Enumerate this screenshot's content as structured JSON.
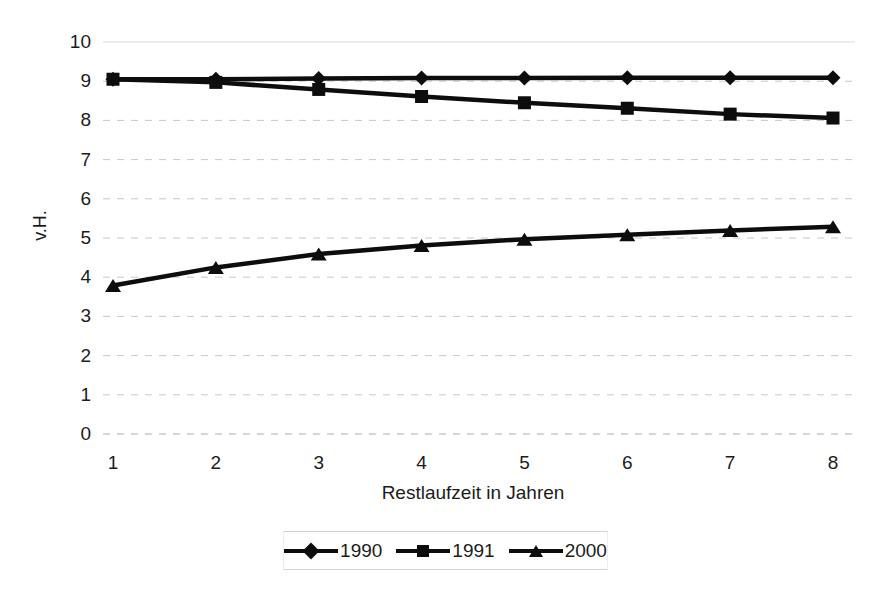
{
  "chart_data": {
    "type": "line",
    "title": "",
    "subtitle": "",
    "xlabel": "Restlaufzeit in Jahren",
    "ylabel": "v.H.",
    "x": [
      1,
      2,
      3,
      4,
      5,
      6,
      7,
      8
    ],
    "categories": [
      "1",
      "2",
      "3",
      "4",
      "5",
      "6",
      "7",
      "8"
    ],
    "xlim": [
      1,
      8
    ],
    "ylim": [
      0,
      10
    ],
    "ytick_labels": [
      "10",
      "9",
      "8",
      "7",
      "6",
      "5",
      "4",
      "3",
      "2",
      "1",
      "0"
    ],
    "ytick_values": [
      10,
      9,
      8,
      7,
      6,
      5,
      4,
      3,
      2,
      1,
      0
    ],
    "grid": "horizontal-dashed",
    "legend_position": "bottom",
    "series": [
      {
        "name": "1990",
        "marker": "diamond",
        "color": "#0d0d0d",
        "values": [
          9.05,
          9.05,
          9.07,
          9.08,
          9.08,
          9.09,
          9.09,
          9.09
        ]
      },
      {
        "name": "1991",
        "marker": "square",
        "color": "#0d0d0d",
        "values": [
          9.05,
          8.97,
          8.79,
          8.61,
          8.45,
          8.31,
          8.16,
          8.06
        ]
      },
      {
        "name": "2000",
        "marker": "triangle",
        "color": "#0d0d0d",
        "values": [
          3.79,
          4.25,
          4.59,
          4.81,
          4.97,
          5.08,
          5.19,
          5.29
        ]
      }
    ]
  },
  "axes": {
    "y_title": "v.H.",
    "x_title": "Restlaufzeit in Jahren"
  },
  "legend": {
    "items": [
      {
        "label": "1990",
        "marker": "diamond"
      },
      {
        "label": "1991",
        "marker": "square"
      },
      {
        "label": "2000",
        "marker": "triangle"
      }
    ]
  },
  "style": {
    "line_color": "#0d0d0d",
    "grid_color": "#c8c8c8",
    "top_grid_color": "#d9d9d9",
    "background": "#ffffff",
    "text_color": "#1c1c1c"
  }
}
